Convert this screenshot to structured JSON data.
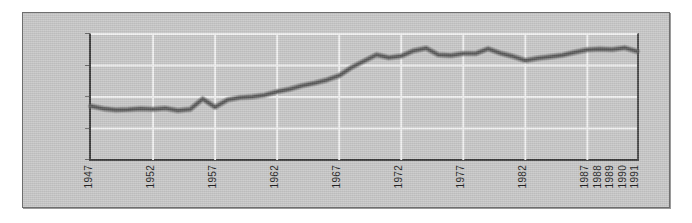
{
  "figure": {
    "background_color": "#c8c8c8",
    "border_color": "#6e6e6e",
    "axis_color": "#3c3c3c",
    "gridline_color": "#f2f2f2",
    "series_color": "#5a5a5a"
  },
  "chart_data": {
    "type": "line",
    "title": "",
    "subtitle": "",
    "xlabel": "",
    "ylabel": "",
    "grid": true,
    "legend": false,
    "legend_position": "none",
    "xlim": [
      1947,
      1991
    ],
    "ylim": [
      0,
      40000
    ],
    "ytick_values": [
      0,
      10000,
      20000,
      30000,
      40000
    ],
    "ytick_labels": [
      "0",
      "$10,000",
      "$20,000",
      "$30,000",
      "$40,000"
    ],
    "xtick_labels": [
      "1947",
      "1952",
      "1957",
      "1962",
      "1967",
      "1972",
      "1977",
      "1982",
      "1987",
      "1988",
      "1989",
      "1990",
      "1991"
    ],
    "xtick_values": [
      1947,
      1952,
      1957,
      1962,
      1967,
      1972,
      1977,
      1982,
      1987,
      1988,
      1989,
      1990,
      1991
    ],
    "x": [
      1947,
      1948,
      1949,
      1950,
      1951,
      1952,
      1953,
      1954,
      1955,
      1956,
      1957,
      1958,
      1959,
      1960,
      1961,
      1962,
      1963,
      1964,
      1965,
      1966,
      1967,
      1968,
      1969,
      1970,
      1971,
      1972,
      1973,
      1974,
      1975,
      1976,
      1977,
      1978,
      1979,
      1980,
      1981,
      1982,
      1983,
      1984,
      1985,
      1986,
      1987,
      1988,
      1989,
      1990,
      1991
    ],
    "values": [
      17100,
      16300,
      15900,
      16000,
      16300,
      16100,
      16400,
      15700,
      16100,
      19400,
      16800,
      19100,
      19800,
      20100,
      20600,
      21700,
      22500,
      23600,
      24400,
      25400,
      26800,
      29400,
      31400,
      33400,
      32500,
      33000,
      34700,
      35500,
      33400,
      33200,
      33800,
      33800,
      35300,
      33900,
      32900,
      31600,
      32300,
      32800,
      33300,
      34200,
      35000,
      35200,
      35100,
      35600,
      34500
    ],
    "series": [
      {
        "name": "value",
        "values": [
          17100,
          16300,
          15900,
          16000,
          16300,
          16100,
          16400,
          15700,
          16100,
          19400,
          16800,
          19100,
          19800,
          20100,
          20600,
          21700,
          22500,
          23600,
          24400,
          25400,
          26800,
          29400,
          31400,
          33400,
          32500,
          33000,
          34700,
          35500,
          33400,
          33200,
          33800,
          33800,
          35300,
          33900,
          32900,
          31600,
          32300,
          32800,
          33300,
          34200,
          35000,
          35200,
          35100,
          35600,
          34500
        ]
      }
    ]
  }
}
